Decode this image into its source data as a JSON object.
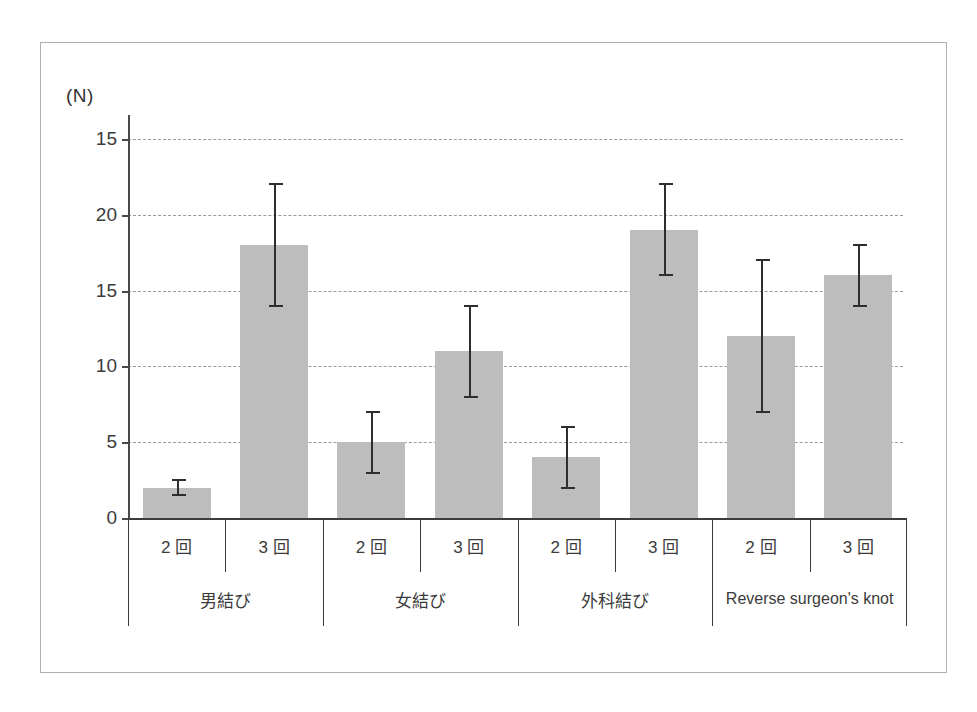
{
  "figure": {
    "unit_label": "(N)",
    "bar_color": "#bdbdbd",
    "error_bar_color": "#2e2e2e",
    "axis_color": "#3d3d3d",
    "gridline_color": "#9a9a9a"
  },
  "chart_data": {
    "type": "bar",
    "title": "",
    "xlabel": "",
    "ylabel": "(N)",
    "ylim": [
      0,
      25
    ],
    "yticks": [
      0,
      5,
      10,
      15,
      20,
      25
    ],
    "ytick_labels": [
      "0",
      "5",
      "10",
      "15",
      "20",
      "15"
    ],
    "grid": true,
    "legend": "none",
    "categories": [
      "2 回",
      "3 回",
      "2 回",
      "3 回",
      "2 回",
      "3 回",
      "2 回",
      "3 回"
    ],
    "values": [
      2,
      18,
      5,
      11,
      4,
      19,
      12,
      16
    ],
    "error_low": [
      1.5,
      14,
      3,
      8,
      2,
      16,
      7,
      14
    ],
    "error_high": [
      2.5,
      22,
      7,
      14,
      6,
      22,
      17,
      18
    ],
    "groups": [
      {
        "label": "男結び",
        "categories": [
          "2 回",
          "3 回"
        ],
        "values": [
          2,
          18
        ]
      },
      {
        "label": "女結び",
        "categories": [
          "2 回",
          "3 回"
        ],
        "values": [
          5,
          11
        ]
      },
      {
        "label": "外科結び",
        "categories": [
          "2 回",
          "3 回"
        ],
        "values": [
          4,
          19
        ]
      },
      {
        "label": "Reverse surgeon's knot",
        "categories": [
          "2 回",
          "3 回"
        ],
        "values": [
          12,
          16
        ]
      }
    ]
  }
}
